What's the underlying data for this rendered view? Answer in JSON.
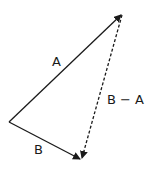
{
  "diagram": {
    "title": "",
    "type": "vector subtraction triangle",
    "colors": {
      "stroke": "#1a1a1a",
      "background": "#ffffff"
    },
    "points": {
      "origin": [
        9,
        122
      ],
      "a_tip": [
        122,
        14
      ],
      "b_tip": [
        81,
        160
      ]
    },
    "vectors": [
      {
        "id": "A",
        "label": "A",
        "from": "origin",
        "to": "a_tip",
        "style": "solid"
      },
      {
        "id": "B",
        "label": "B",
        "from": "origin",
        "to": "b_tip",
        "style": "solid"
      },
      {
        "id": "B-A",
        "label": "B − A",
        "from": "a_tip",
        "to": "b_tip",
        "style": "dashed"
      }
    ],
    "labels": {
      "a": "A",
      "b": "B",
      "b_minus_a": "B − A"
    }
  }
}
